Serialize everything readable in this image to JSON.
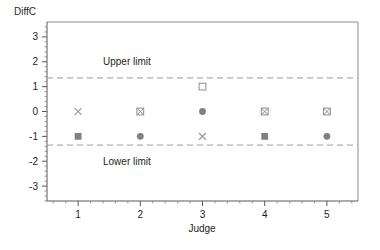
{
  "chart_data": {
    "type": "scatter",
    "title": "",
    "xlabel": "Judge",
    "ylabel": "DiffC",
    "xlim": [
      0.5,
      5.5
    ],
    "ylim": [
      -3.6,
      3.6
    ],
    "x_ticks": [
      1,
      2,
      3,
      4,
      5
    ],
    "y_ticks": [
      -3,
      -2,
      -1,
      0,
      1,
      2,
      3
    ],
    "x_tick_labels": [
      "1",
      "2",
      "3",
      "4",
      "5"
    ],
    "y_tick_labels": [
      "-3",
      "-2",
      "-1",
      "0",
      "1",
      "2",
      "3"
    ],
    "grid": false,
    "legend": "none",
    "minor_ticks": true,
    "reference_lines": [
      {
        "name": "upper-limit",
        "label": "Upper limit",
        "value": 1.35,
        "style": "dashed",
        "color": "#9a9a9a",
        "label_x": 1.4,
        "label_y": 2.0
      },
      {
        "name": "lower-limit",
        "label": "Lower limit",
        "value": -1.35,
        "style": "dashed",
        "color": "#9a9a9a",
        "label_x": 1.4,
        "label_y": -2.0
      }
    ],
    "points": [
      {
        "x": 1,
        "y": 0,
        "marker": "x-mark",
        "color": "#9a9a9a"
      },
      {
        "x": 1,
        "y": -1,
        "marker": "filled-square",
        "color": "#808080"
      },
      {
        "x": 2,
        "y": 0,
        "marker": "crossed-square",
        "color": "#8c8c8c"
      },
      {
        "x": 2,
        "y": -1,
        "marker": "filled-circle",
        "color": "#808080"
      },
      {
        "x": 3,
        "y": 1,
        "marker": "open-square",
        "color": "#8c8c8c"
      },
      {
        "x": 3,
        "y": 0,
        "marker": "filled-circle",
        "color": "#808080"
      },
      {
        "x": 3,
        "y": -1,
        "marker": "x-mark",
        "color": "#9a9a9a"
      },
      {
        "x": 4,
        "y": 0,
        "marker": "crossed-square",
        "color": "#8c8c8c"
      },
      {
        "x": 4,
        "y": -1,
        "marker": "filled-square",
        "color": "#808080"
      },
      {
        "x": 5,
        "y": 0,
        "marker": "crossed-square",
        "color": "#8c8c8c"
      },
      {
        "x": 5,
        "y": -1,
        "marker": "filled-circle",
        "color": "#808080"
      }
    ]
  },
  "axes": {
    "y_title": "DiffC",
    "x_title": "Judge"
  },
  "colors": {
    "frame": "#8c8c8c",
    "axis": "#58595b",
    "limit": "#9a9a9a",
    "marker_fill": "#808080",
    "text": "#231f20",
    "background": "#ffffff"
  }
}
